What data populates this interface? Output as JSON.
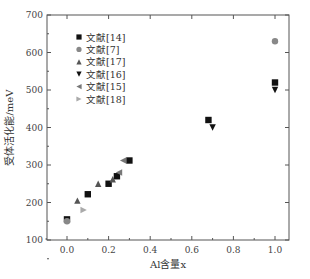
{
  "chart_data": {
    "type": "scatter",
    "title": "",
    "xlabel": "Al含量x",
    "ylabel": "受体活化能/meV",
    "xlim": [
      -0.1,
      1.05
    ],
    "ylim": [
      100,
      700
    ],
    "xticks": [
      "0.0",
      "0.2",
      "0.4",
      "0.6",
      "0.8",
      "1.0"
    ],
    "yticks": [
      "100",
      "200",
      "300",
      "400",
      "500",
      "600",
      "700"
    ],
    "grid": false,
    "legend_position": "upper-left",
    "series": [
      {
        "name": "文献[14]",
        "marker": "square",
        "color": "#111111",
        "points": [
          [
            0.0,
            155
          ],
          [
            0.1,
            222
          ],
          [
            0.2,
            250
          ],
          [
            0.24,
            270
          ],
          [
            0.3,
            312
          ],
          [
            0.68,
            420
          ],
          [
            1.0,
            520
          ]
        ]
      },
      {
        "name": "文献[7]",
        "marker": "circle",
        "color": "#888888",
        "points": [
          [
            0.0,
            150
          ],
          [
            1.0,
            630
          ]
        ]
      },
      {
        "name": "文献[17]",
        "marker": "triangle-up",
        "color": "#555555",
        "points": [
          [
            0.05,
            205
          ],
          [
            0.15,
            250
          ],
          [
            0.22,
            262
          ]
        ]
      },
      {
        "name": "文献[16]",
        "marker": "triangle-down",
        "color": "#111111",
        "points": [
          [
            0.7,
            400
          ],
          [
            1.0,
            500
          ]
        ]
      },
      {
        "name": "文献[15]",
        "marker": "triangle-left",
        "color": "#777777",
        "points": [
          [
            0.27,
            312
          ],
          [
            0.25,
            280
          ]
        ]
      },
      {
        "name": "文献[18]",
        "marker": "triangle-right",
        "color": "#aaaaaa",
        "points": [
          [
            0.08,
            180
          ]
        ]
      }
    ]
  }
}
